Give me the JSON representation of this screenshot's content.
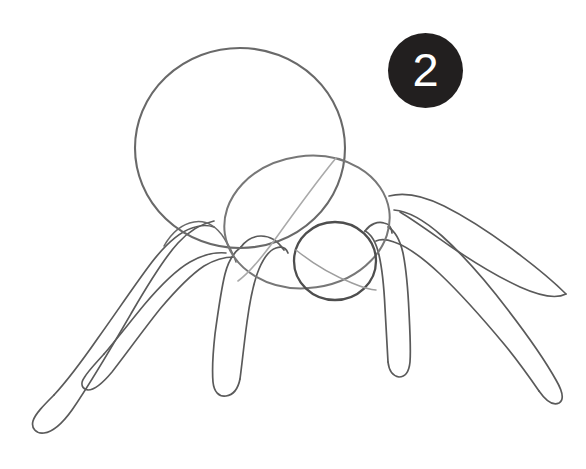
{
  "page": {
    "background_color": "#ffffff",
    "width": 586,
    "height": 469
  },
  "step_badge": {
    "number": "2",
    "background_color": "#221f1f",
    "text_color": "#ffffff",
    "shape": "circle",
    "center_x": 425,
    "center_y": 71,
    "diameter": 75
  },
  "drawing": {
    "subject": "spider",
    "medium": "pencil sketch",
    "style": "construction-lines tutorial",
    "stroke_color_dark": "#4a4a4a",
    "stroke_color_mid": "#6b6b6b",
    "stroke_color_light": "#9a9a9a",
    "parts": [
      {
        "name": "abdomen",
        "shape": "circle",
        "cx": 240,
        "cy": 148,
        "rx": 105,
        "ry": 100
      },
      {
        "name": "cephalothorax",
        "shape": "ellipse",
        "cx": 307,
        "cy": 222,
        "rx": 83,
        "ry": 66,
        "rotation": -8
      },
      {
        "name": "head",
        "shape": "circle",
        "cx": 335,
        "cy": 261,
        "rx": 41,
        "ry": 39
      },
      {
        "name": "leg-left-outer",
        "count": 1,
        "direction": "down-left",
        "foot_x": 50,
        "foot_y": 437
      },
      {
        "name": "leg-left-inner",
        "count": 1,
        "direction": "down-left",
        "foot_x": 98,
        "foot_y": 392
      },
      {
        "name": "leg-front-left",
        "count": 1,
        "direction": "down",
        "foot_x": 224,
        "foot_y": 394
      },
      {
        "name": "leg-right-inner",
        "count": 1,
        "direction": "down",
        "foot_x": 412,
        "foot_y": 375
      },
      {
        "name": "leg-right-outer",
        "count": 1,
        "direction": "down-right",
        "foot_x": 557,
        "foot_y": 403
      },
      {
        "name": "leg-right-upper",
        "count": 1,
        "direction": "right",
        "foot_x": 500,
        "foot_y": 330
      }
    ]
  }
}
